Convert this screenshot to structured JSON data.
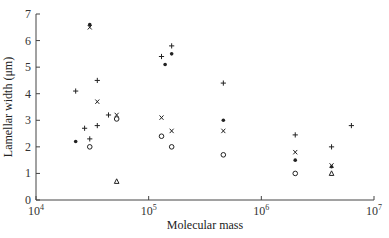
{
  "chart_data": {
    "type": "scatter",
    "title": "",
    "xlabel": "Molecular mass",
    "ylabel": "Lamellar width (μm)",
    "xscale": "log",
    "xlim": [
      10000,
      10000000
    ],
    "ylim": [
      0,
      7
    ],
    "x_ticks": [
      {
        "value": 10000,
        "base": "10",
        "exp": "4"
      },
      {
        "value": 100000,
        "base": "10",
        "exp": "5"
      },
      {
        "value": 1000000,
        "base": "10",
        "exp": "6"
      },
      {
        "value": 10000000,
        "base": "10",
        "exp": "7"
      }
    ],
    "y_ticks": [
      "0",
      "1",
      "2",
      "3",
      "4",
      "5",
      "6",
      "7"
    ],
    "grid": false,
    "legend": null,
    "series": [
      {
        "name": "plus",
        "marker": "+",
        "points": [
          {
            "x": 22500,
            "y": 4.1
          },
          {
            "x": 27000,
            "y": 2.7
          },
          {
            "x": 30000,
            "y": 2.3
          },
          {
            "x": 35000,
            "y": 4.5
          },
          {
            "x": 35000,
            "y": 2.8
          },
          {
            "x": 44000,
            "y": 3.2
          },
          {
            "x": 130000,
            "y": 5.4
          },
          {
            "x": 160000,
            "y": 5.8
          },
          {
            "x": 460000,
            "y": 4.4
          },
          {
            "x": 2000000,
            "y": 2.45
          },
          {
            "x": 4200000,
            "y": 2.0
          },
          {
            "x": 6300000,
            "y": 2.8
          }
        ]
      },
      {
        "name": "cross",
        "marker": "x",
        "points": [
          {
            "x": 30000,
            "y": 6.5
          },
          {
            "x": 35000,
            "y": 3.7
          },
          {
            "x": 52000,
            "y": 3.2
          },
          {
            "x": 130000,
            "y": 3.1
          },
          {
            "x": 160000,
            "y": 2.6
          },
          {
            "x": 460000,
            "y": 2.6
          },
          {
            "x": 2000000,
            "y": 1.8
          },
          {
            "x": 4200000,
            "y": 1.3
          }
        ]
      },
      {
        "name": "dot",
        "marker": "filled-circle",
        "points": [
          {
            "x": 22500,
            "y": 2.2
          },
          {
            "x": 30000,
            "y": 6.6
          },
          {
            "x": 140000,
            "y": 5.1
          },
          {
            "x": 160000,
            "y": 5.5
          },
          {
            "x": 460000,
            "y": 3.0
          },
          {
            "x": 2000000,
            "y": 1.5
          },
          {
            "x": 4200000,
            "y": 1.25
          }
        ]
      },
      {
        "name": "circle",
        "marker": "open-circle",
        "points": [
          {
            "x": 30000,
            "y": 2.0
          },
          {
            "x": 52000,
            "y": 3.05
          },
          {
            "x": 130000,
            "y": 2.4
          },
          {
            "x": 160000,
            "y": 2.0
          },
          {
            "x": 460000,
            "y": 1.7
          },
          {
            "x": 2000000,
            "y": 1.0
          }
        ]
      },
      {
        "name": "triangle",
        "marker": "open-triangle",
        "points": [
          {
            "x": 52000,
            "y": 0.7
          },
          {
            "x": 4200000,
            "y": 1.0
          }
        ]
      }
    ]
  }
}
